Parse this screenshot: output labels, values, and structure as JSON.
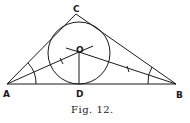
{
  "figure": {
    "caption": "Fig. 12.",
    "points": {
      "A": {
        "label": "A",
        "x": 7,
        "y": 84
      },
      "B": {
        "label": "B",
        "x": 176,
        "y": 84
      },
      "C": {
        "label": "C",
        "x": 76,
        "y": 14
      },
      "O": {
        "label": "O",
        "x": 79,
        "y": 52
      },
      "D": {
        "label": "D",
        "x": 79,
        "y": 84
      }
    },
    "incircle": {
      "center": "O",
      "radius": 31
    }
  }
}
